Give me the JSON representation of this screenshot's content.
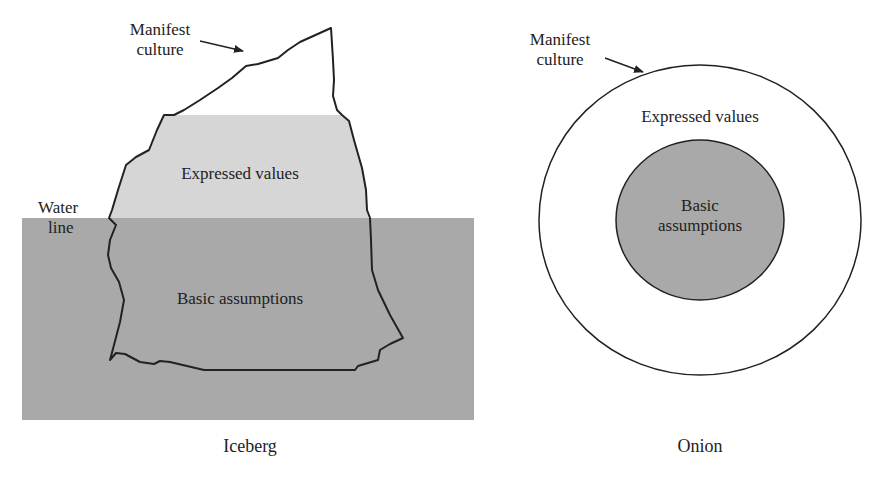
{
  "colors": {
    "background": "#ffffff",
    "outline": "#222222",
    "expressed_values_fill": "#d6d6d6",
    "basic_assumptions_fill": "#a9a9a9",
    "water_fill": "#a9a9a9"
  },
  "iceberg": {
    "caption": "Iceberg",
    "manifest_label_line1": "Manifest",
    "manifest_label_line2": "culture",
    "expressed_values": "Expressed values",
    "water_line_line1": "Water",
    "water_line_line2": "line",
    "basic_assumptions": "Basic assumptions"
  },
  "onion": {
    "caption": "Onion",
    "manifest_label_line1": "Manifest",
    "manifest_label_line2": "culture",
    "expressed_values": "Expressed values",
    "basic_assumptions_line1": "Basic",
    "basic_assumptions_line2": "assumptions"
  }
}
